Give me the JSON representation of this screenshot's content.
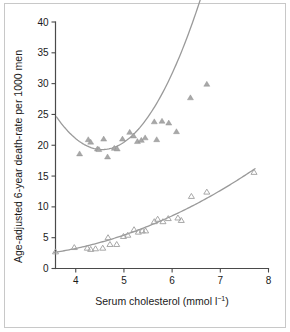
{
  "chart_data": {
    "type": "scatter",
    "title": "",
    "xlabel": "Serum cholesterol (mmol l⁻¹)",
    "xlabel_main": "Serum cholesterol (mmol l",
    "xlabel_sup": "−1",
    "xlabel_tail": ")",
    "ylabel": "Age-adjusted 6-year death-rate per 1000 men",
    "xlim": [
      3.58,
      8.0
    ],
    "ylim": [
      0,
      40
    ],
    "xticks": [
      4,
      5,
      6,
      7,
      8
    ],
    "xtick_labels": [
      "4",
      "5",
      "6",
      "7",
      "8"
    ],
    "yticks": [
      0,
      5,
      10,
      15,
      20,
      25,
      30,
      35,
      40
    ],
    "ytick_labels": [
      "0",
      "5",
      "10",
      "15",
      "20",
      "25",
      "30",
      "35",
      "40"
    ],
    "grid": false,
    "legend": "none",
    "colors": {
      "curve": "#9a9a9a",
      "marker_filled": "#a8a8a8",
      "marker_open": "#9e9e9e",
      "axis": "#4a4a4a",
      "text": "#1a1a1a",
      "frame": "#c8c8c8",
      "background": "#ffffff"
    },
    "series": [
      {
        "name": "All-cause mortality",
        "marker": "filled-triangle",
        "points": [
          {
            "x": 4.08,
            "y": 18.6
          },
          {
            "x": 4.26,
            "y": 20.9
          },
          {
            "x": 4.31,
            "y": 20.5
          },
          {
            "x": 4.45,
            "y": 19.4
          },
          {
            "x": 4.48,
            "y": 19.3
          },
          {
            "x": 4.58,
            "y": 21.0
          },
          {
            "x": 4.66,
            "y": 18.1
          },
          {
            "x": 4.8,
            "y": 19.5
          },
          {
            "x": 4.86,
            "y": 19.4
          },
          {
            "x": 4.97,
            "y": 21.0
          },
          {
            "x": 5.12,
            "y": 22.1
          },
          {
            "x": 5.2,
            "y": 21.5
          },
          {
            "x": 5.28,
            "y": 20.6
          },
          {
            "x": 5.36,
            "y": 20.8
          },
          {
            "x": 5.44,
            "y": 21.2
          },
          {
            "x": 5.63,
            "y": 23.8
          },
          {
            "x": 5.68,
            "y": 20.9
          },
          {
            "x": 5.79,
            "y": 23.9
          },
          {
            "x": 5.93,
            "y": 23.6
          },
          {
            "x": 6.09,
            "y": 22.2
          },
          {
            "x": 6.38,
            "y": 27.7
          },
          {
            "x": 6.72,
            "y": 29.9
          }
        ],
        "fit_curve": {
          "shape": "u-shaped-quadratic",
          "x_start": 3.6,
          "x_end": 7.68,
          "y_start": 24.6,
          "y_min": 19.3,
          "x_at_min": 4.55,
          "y_end": 36.6
        }
      },
      {
        "name": "Coronary heart disease mortality",
        "marker": "open-triangle",
        "points": [
          {
            "x": 3.58,
            "y": 2.7
          },
          {
            "x": 3.97,
            "y": 3.4
          },
          {
            "x": 4.24,
            "y": 3.3
          },
          {
            "x": 4.31,
            "y": 3.1
          },
          {
            "x": 4.41,
            "y": 3.2
          },
          {
            "x": 4.56,
            "y": 3.3
          },
          {
            "x": 4.67,
            "y": 5.0
          },
          {
            "x": 4.71,
            "y": 3.9
          },
          {
            "x": 4.85,
            "y": 3.9
          },
          {
            "x": 4.99,
            "y": 5.2
          },
          {
            "x": 5.08,
            "y": 5.4
          },
          {
            "x": 5.21,
            "y": 6.3
          },
          {
            "x": 5.3,
            "y": 5.9
          },
          {
            "x": 5.38,
            "y": 6.1
          },
          {
            "x": 5.45,
            "y": 6.1
          },
          {
            "x": 5.63,
            "y": 7.6
          },
          {
            "x": 5.7,
            "y": 8.0
          },
          {
            "x": 5.81,
            "y": 7.6
          },
          {
            "x": 5.92,
            "y": 8.1
          },
          {
            "x": 6.12,
            "y": 8.2
          },
          {
            "x": 6.19,
            "y": 7.8
          },
          {
            "x": 6.4,
            "y": 11.7
          },
          {
            "x": 6.72,
            "y": 12.4
          },
          {
            "x": 7.7,
            "y": 15.6
          }
        ],
        "fit_curve": {
          "shape": "monotonic-increasing-quadratic",
          "x_start": 3.55,
          "x_end": 7.72,
          "y_start": 2.6,
          "y_end": 16.2
        }
      }
    ]
  }
}
